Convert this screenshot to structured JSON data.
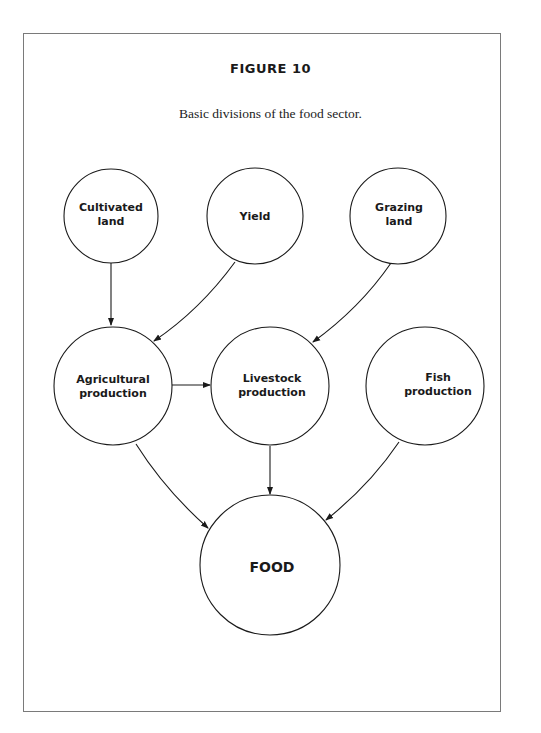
{
  "figure": {
    "title": "FIGURE 10",
    "caption": "Basic divisions of the food sector."
  },
  "nodes": {
    "cultivated_land": {
      "line1": "Cultivated",
      "line2": "land"
    },
    "yield": {
      "line1": "Yield"
    },
    "grazing_land": {
      "line1": "Grazing",
      "line2": "land"
    },
    "agricultural_production": {
      "line1": "Agricultural",
      "line2": "production"
    },
    "livestock_production": {
      "line1": "Livestock",
      "line2": "production"
    },
    "fish_production": {
      "line1": "Fish",
      "line2": "production"
    },
    "food": {
      "line1": "FOOD"
    }
  },
  "edges": [
    {
      "from": "Cultivated land",
      "to": "Agricultural production"
    },
    {
      "from": "Yield",
      "to": "Agricultural production"
    },
    {
      "from": "Grazing land",
      "to": "Livestock production"
    },
    {
      "from": "Agricultural production",
      "to": "Livestock production"
    },
    {
      "from": "Agricultural production",
      "to": "FOOD"
    },
    {
      "from": "Livestock production",
      "to": "FOOD"
    },
    {
      "from": "Fish production",
      "to": "FOOD"
    }
  ]
}
